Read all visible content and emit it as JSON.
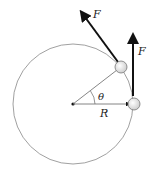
{
  "diagram": {
    "labels": {
      "force_top": "F",
      "force_right": "F",
      "angle": "θ",
      "radius": "R"
    },
    "geometry": {
      "center": [
        73,
        104
      ],
      "radius": 60
    },
    "colors": {
      "circle": "#888888",
      "arrow": "#111111",
      "ball_fill": "#e6e6e6",
      "ball_stroke": "#777777"
    }
  }
}
